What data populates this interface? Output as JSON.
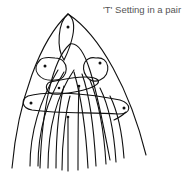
{
  "caption": "'T' Setting in a pair",
  "diagram": {
    "type": "lacemaking-pin-diagram",
    "threads_count": 14,
    "pins": [
      {
        "id": "top",
        "x": 68,
        "y": 27
      },
      {
        "id": "left",
        "x": 45,
        "y": 66
      },
      {
        "id": "right",
        "x": 100,
        "y": 63
      },
      {
        "id": "center-left",
        "x": 59,
        "y": 88
      },
      {
        "id": "center-right",
        "x": 79,
        "y": 86
      },
      {
        "id": "far-left",
        "x": 31,
        "y": 103
      },
      {
        "id": "far-right",
        "x": 124,
        "y": 108
      },
      {
        "id": "center-low",
        "x": 68,
        "y": 117
      }
    ],
    "colors": {
      "line": "#111111",
      "caption": "#555555",
      "background": "#ffffff"
    }
  }
}
